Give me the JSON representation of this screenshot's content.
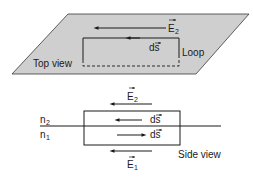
{
  "figure": {
    "top_view": {
      "plane_fill": "#cfcfcf",
      "plane_stroke": "#3a3a3a",
      "label": "Top view",
      "loop_label": "Loop",
      "field": {
        "symbol": "E",
        "subscript": "2",
        "direction": "left"
      },
      "path_element": {
        "symbol": "ds",
        "direction": "left"
      }
    },
    "side_view": {
      "label": "Side view",
      "media": [
        {
          "symbol": "n",
          "subscript": "2",
          "position": "upper"
        },
        {
          "symbol": "n",
          "subscript": "1",
          "position": "lower"
        }
      ],
      "fields": [
        {
          "symbol": "E",
          "subscript": "2",
          "position": "above",
          "direction": "left"
        },
        {
          "symbol": "E",
          "subscript": "1",
          "position": "below",
          "direction": "left"
        }
      ],
      "path_elements": [
        {
          "symbol": "ds",
          "position": "upper",
          "direction": "left"
        },
        {
          "symbol": "ds",
          "position": "lower",
          "direction": "right"
        }
      ]
    },
    "line_color": "#1a1a1a"
  }
}
